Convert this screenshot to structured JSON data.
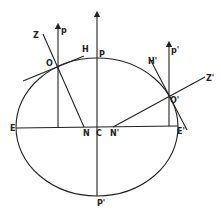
{
  "diagram": {
    "type": "geometric",
    "labels": {
      "Z": "Z",
      "p": "p",
      "O": "O",
      "H": "H",
      "P": "P",
      "H_prime": "H'",
      "p_prime": "p'",
      "Z_prime": "Z'",
      "O_prime": "O'",
      "E": "E",
      "N": "N",
      "C": "C",
      "N_prime": "N'",
      "E_prime": "E'",
      "P_prime": "P'"
    },
    "colors": {
      "stroke": "#222222",
      "background": "#ffffff"
    }
  }
}
